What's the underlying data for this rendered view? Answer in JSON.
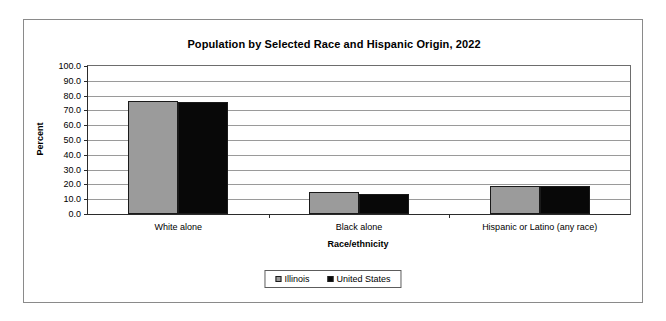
{
  "chart_data": {
    "type": "bar",
    "title": "Population by Selected Race and Hispanic Origin, 2022",
    "xlabel": "Race/ethnicity",
    "ylabel": "Percent",
    "ylim": [
      0,
      100
    ],
    "ytick_step": 10,
    "ytick_labels": [
      "0.0",
      "10.0",
      "20.0",
      "30.0",
      "40.0",
      "50.0",
      "60.0",
      "70.0",
      "80.0",
      "90.0",
      "100.0"
    ],
    "grid": true,
    "legend_position": "bottom-center",
    "categories": [
      "White alone",
      "Black alone",
      "Hispanic or Latino (any race)"
    ],
    "series": [
      {
        "name": "Illinois",
        "color": "#9b9b9b",
        "values": [
          76.5,
          14.6,
          18.6
        ]
      },
      {
        "name": "United States",
        "color": "#080808",
        "values": [
          75.5,
          13.6,
          19.1
        ]
      }
    ]
  },
  "legend": {
    "entries": [
      {
        "label": "Illinois"
      },
      {
        "label": "United States"
      }
    ]
  }
}
